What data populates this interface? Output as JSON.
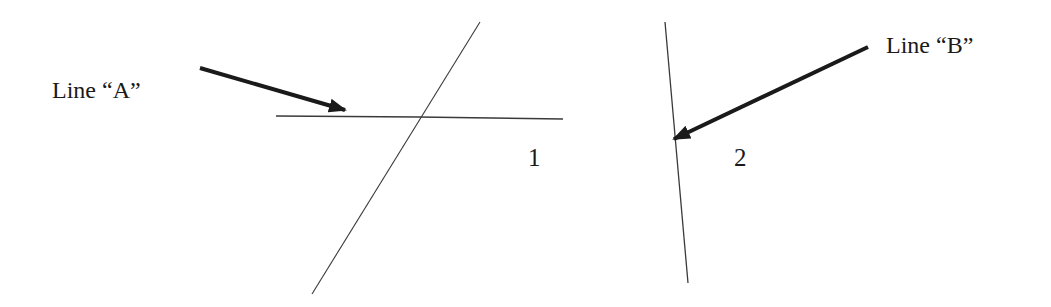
{
  "diagram": {
    "labels": {
      "line_a": "Line “A”",
      "line_b": "Line “B”",
      "region_1": "1",
      "region_2": "2"
    },
    "colors": {
      "line": "#3a3a3a",
      "arrow": "#1a1a1a",
      "text": "#1a1a1a",
      "background": "#ffffff"
    },
    "figure_1": {
      "horizontal_line": {
        "x1": 276,
        "y1": 116,
        "x2": 563,
        "y2": 119
      },
      "diagonal_line": {
        "x1": 480,
        "y1": 22,
        "x2": 312,
        "y2": 294
      },
      "arrow_a": {
        "x1": 200,
        "y1": 68,
        "x2": 345,
        "y2": 110
      }
    },
    "figure_2": {
      "vertical_line": {
        "x1": 665,
        "y1": 22,
        "x2": 688,
        "y2": 283
      },
      "arrow_b": {
        "x1": 868,
        "y1": 47,
        "x2": 674,
        "y2": 139
      }
    }
  }
}
